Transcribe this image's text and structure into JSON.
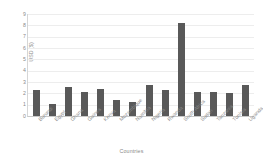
{
  "chart_data": {
    "type": "bar",
    "title": "",
    "subtitle": "",
    "xlabel": "Countries",
    "ylabel": "USD ($)",
    "ylim": [
      0,
      9
    ],
    "yticks": [
      0,
      1,
      2,
      3,
      4,
      5,
      6,
      7,
      8,
      9
    ],
    "grid": true,
    "legend": false,
    "legend_position": "none",
    "bar_color": "#595959",
    "gridline_color": "#ededed",
    "axis_color": "#d6d6d6",
    "label_color": "#8a8a8a",
    "categories": [
      "Burundi",
      "Egypt",
      "Ghana",
      "Guinea",
      "Kenya",
      "Mozambique",
      "Namibia",
      "Nigeria",
      "Rwanda",
      "South Africa",
      "Sudan",
      "Tanzania",
      "Tunisia",
      "Uganda"
    ],
    "values": [
      2.3,
      1.1,
      2.6,
      2.1,
      2.35,
      1.45,
      1.2,
      2.7,
      2.3,
      8.2,
      2.15,
      2.15,
      2.0,
      2.7
    ]
  }
}
